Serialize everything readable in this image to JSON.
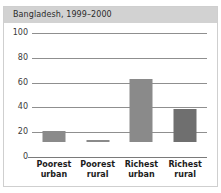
{
  "top_remnant": "",
  "header": {
    "title": "Bangladesh, 1999–2000"
  },
  "colors": {
    "title_bar": "#d2d2d2",
    "card_border": "#cfcfcf",
    "gridline": "#8f8f8f",
    "baseline": "#7a7a7a",
    "bar_light": "#8a8a8a",
    "bar_dark": "#6f6f6f",
    "text": "#1c1c1c"
  },
  "chart_data": {
    "type": "bar",
    "title": "Bangladesh, 1999–2000",
    "xlabel": "",
    "ylabel": "",
    "ylim": [
      0,
      100
    ],
    "yticks": [
      0,
      20,
      40,
      60,
      80,
      100
    ],
    "ytick_labels": [
      "0",
      "20",
      "40",
      "60",
      "80",
      "100"
    ],
    "grid": true,
    "legend": false,
    "categories": [
      "Poorest urban",
      "Poorest rural",
      "Richest urban",
      "Richest rural"
    ],
    "category_lines": [
      [
        "Poorest",
        "urban"
      ],
      [
        "Poorest",
        "rural"
      ],
      [
        "Richest",
        "urban"
      ],
      [
        "Richest",
        "rural"
      ]
    ],
    "values": [
      9,
      2,
      51,
      27
    ],
    "bar_colors": [
      "#8a8a8a",
      "#8a8a8a",
      "#8a8a8a",
      "#6f6f6f"
    ]
  }
}
